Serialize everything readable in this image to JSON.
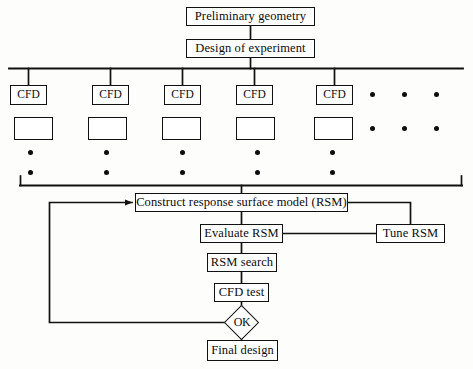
{
  "diagram": {
    "line_color": "#111111",
    "box_fill": "#ffffff",
    "background": "#fdfdfb",
    "nodes": {
      "preliminary_geometry": "Preliminary geometry",
      "design_of_experiment": "Design of experiment",
      "cfd_1": "CFD",
      "cfd_2": "CFD",
      "cfd_3": "CFD",
      "cfd_4": "CFD",
      "cfd_5": "CFD",
      "result_box_1": "",
      "result_box_2": "",
      "result_box_3": "",
      "result_box_4": "",
      "result_box_5": "",
      "construct_rsm": "Construct response surface model (RSM)",
      "evaluate_rsm": "Evaluate RSM",
      "tune_rsm": "Tune RSM",
      "rsm_search": "RSM search",
      "cfd_test": "CFD test",
      "decision_ok": "OK",
      "final_design": "Final design"
    },
    "ellipsis": {
      "row_cfd": [
        "•",
        "•",
        "•"
      ],
      "row_result": [
        "•",
        "•",
        "•"
      ],
      "column_dots_per_branch": 2,
      "branch_count": 5
    }
  }
}
